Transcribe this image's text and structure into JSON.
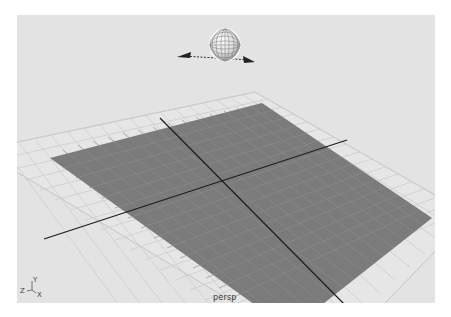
{
  "viewport": {
    "camera_label": "persp",
    "background_color": "#e3e3e3",
    "plane_color": "#7b7b7b",
    "grid_color": "#c8c8c8",
    "axis_line_color": "#1e1e1e"
  },
  "axis_indicator": {
    "y_label": "Y",
    "z_label": "Z",
    "x_label": "X"
  },
  "manipulator": {
    "name": "sphere-light-manipulator"
  }
}
